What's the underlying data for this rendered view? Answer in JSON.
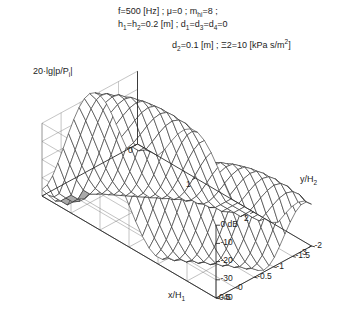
{
  "figure": {
    "caption_lines": [
      "f=500 [Hz]  ;  μ=0  ;  m_hi=8  ;",
      "h1=h2=0.2 [m]  ;  d1=d3=d4=0",
      "d2=0.1 [m]  ;  Ξ2=10 [kPa s/m2]"
    ],
    "params": {
      "frequency": "f=500 [Hz]",
      "mu": "μ=0",
      "m_hi": "m",
      "m_hi_sub": "hi",
      "m_hi_val": "=8",
      "h_label": "h",
      "h1_sub": "1",
      "h_eq": "=h",
      "h2_sub": "2",
      "h_val": "=0.2 [m]",
      "d1": "d",
      "d1_sub": "1",
      "d1_eq": "=d",
      "d3_sub": "3",
      "d3_eq": "=d",
      "d4_sub": "4",
      "d4_val": "=0",
      "d2": "d",
      "d2_sub": "2",
      "d2_val": "=0.1 [m]",
      "xi": "Ξ2=10 [kPa s/m",
      "xi_sup": "2",
      "xi_end": "]",
      "semi": ";"
    },
    "zaxis_label": {
      "main": "20·lg|p/P",
      "sub": "i",
      "end": "|"
    },
    "background": "#ffffff",
    "line_color": "#2b2b2b",
    "grid_color": "#7a7a7a",
    "shade_color": "#a9a9a9"
  },
  "chart_data": {
    "type": "surface",
    "title": "",
    "xlabel": "x/H1",
    "xlabel_main": "x/H",
    "xlabel_sub": "1",
    "ylabel": "y/H2",
    "ylabel_main": "y/H",
    "ylabel_sub": "2",
    "zlabel": "20·lg|p/Pi| [dB]",
    "xticks": [
      "0",
      "1",
      "2",
      "3"
    ],
    "xtick_values": [
      0,
      1,
      2,
      3
    ],
    "yticks": [
      "0.5",
      "0",
      "-0.5",
      "-1",
      "-1.5",
      "-2"
    ],
    "ytick_values": [
      0.5,
      0,
      -0.5,
      -1,
      -1.5,
      -2
    ],
    "zticks": [
      "0 dB",
      "-10",
      "-20",
      "-30",
      "-40"
    ],
    "ztick_values": [
      0,
      -10,
      -20,
      -30,
      -40
    ],
    "xlim": [
      0,
      3
    ],
    "ylim": [
      -2,
      0.5
    ],
    "zlim": [
      -40,
      5
    ],
    "grid": true,
    "legend": "none",
    "z_surface_nx": 26,
    "z_surface_ny": 18,
    "ridge_crest_db": 2,
    "valley_floor_db": -38,
    "mesh_line_width": 0.6
  }
}
